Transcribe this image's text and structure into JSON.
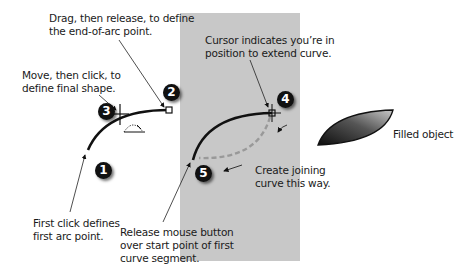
{
  "panel": {
    "color": "#c8c8c8"
  },
  "annotations": {
    "drag": {
      "line1": "Drag, then release, to define",
      "line2": "the end-of-arc point."
    },
    "move": {
      "line1": "Move, then click, to",
      "line2": "define final shape."
    },
    "first_click": {
      "line1": "First click defines",
      "line2": "first arc point."
    },
    "cursor": {
      "line1": "Cursor indicates you’re in",
      "line2": "position to extend curve."
    },
    "create_joining": {
      "line1": "Create joining",
      "line2": "curve this way."
    },
    "release": {
      "line1": "Release mouse button",
      "line2": "over start point of first",
      "line3": "curve segment."
    },
    "filled": {
      "text": "Filled object"
    }
  },
  "steps": [
    {
      "number": "1"
    },
    {
      "number": "2"
    },
    {
      "number": "3"
    },
    {
      "number": "4"
    },
    {
      "number": "5"
    }
  ],
  "icons": {
    "arc_tool_cursor": "arc-tool-cursor-icon",
    "crosshair_cursor": "crosshair-cursor-icon",
    "end_point": "square-anchor-point-icon"
  },
  "filled_object": {
    "gradient_dark": "#111111",
    "gradient_light": "#bdbdbd"
  }
}
